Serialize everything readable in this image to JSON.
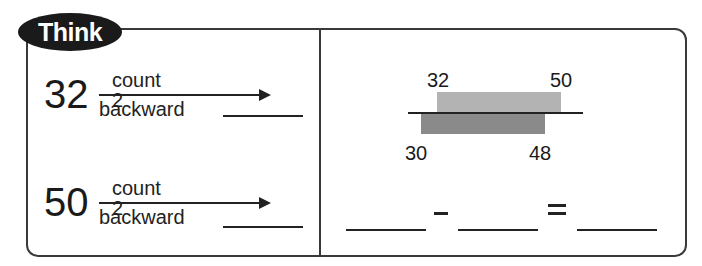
{
  "badge": {
    "label": "Think"
  },
  "left": {
    "rows": [
      {
        "number": "32",
        "top_label": "count 2",
        "bottom_label": "backward"
      },
      {
        "number": "50",
        "top_label": "count 2",
        "bottom_label": "backward"
      }
    ]
  },
  "right": {
    "diagram": {
      "top_labels": [
        "32",
        "50"
      ],
      "bottom_labels": [
        "30",
        "48"
      ],
      "colors": {
        "top_bar": "#b3b3b3",
        "bottom_bar": "#8a8a8a",
        "line": "#222222"
      }
    },
    "equation": {
      "minus": "−",
      "equals": "="
    }
  }
}
